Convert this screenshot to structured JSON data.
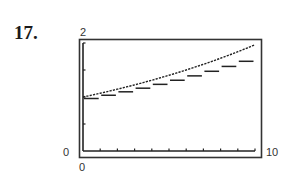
{
  "problem_number": "17.",
  "chart_data": {
    "type": "line",
    "title": "",
    "xlabel": "",
    "ylabel": "",
    "xlim": [
      0,
      10
    ],
    "ylim": [
      0,
      2
    ],
    "x_tick_labels": [
      "0",
      "10"
    ],
    "y_tick_labels": [
      "0",
      "2"
    ],
    "x_ticks": [
      1,
      2,
      3,
      4,
      5,
      6,
      7,
      8,
      9,
      10
    ],
    "y_ticks": [
      0.5,
      1,
      1.5,
      2
    ],
    "grid": false,
    "legend": null,
    "series": [
      {
        "name": "continuous",
        "style": "smooth curve",
        "x": [
          0,
          1,
          2,
          3,
          4,
          5,
          6,
          7,
          8,
          9,
          10
        ],
        "y": [
          1.0,
          1.07,
          1.145,
          1.225,
          1.311,
          1.403,
          1.501,
          1.606,
          1.718,
          1.838,
          1.967
        ]
      },
      {
        "name": "step",
        "style": "step function",
        "x": [
          0,
          1,
          2,
          3,
          4,
          5,
          6,
          7,
          8,
          9
        ],
        "y": [
          1.0,
          1.06,
          1.124,
          1.191,
          1.262,
          1.338,
          1.419,
          1.504,
          1.594,
          1.689
        ]
      }
    ]
  },
  "labels": {
    "ymax": "2",
    "ymin": "0",
    "xmin": "0",
    "xmax": "10"
  }
}
